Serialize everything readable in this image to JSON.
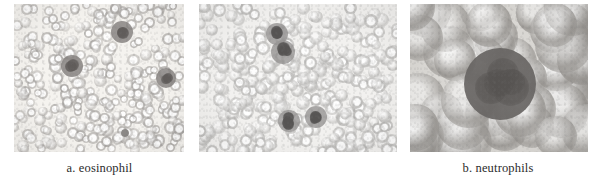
{
  "figure": {
    "background_color": "#ffffff",
    "panel_count": 3,
    "caption_color": "#2b2b2b",
    "panels": [
      {
        "id": "eosinophil",
        "caption": "a. eosinophil",
        "label_letter": "a.",
        "cell_type": "eosinophil",
        "description": "low-power blood smear field, numerous pale ring-shaped red blood cells with three darker stained eosinophils",
        "field_background": "#f5f3ef",
        "rbc_color": "#b9b6b2",
        "wbc_color": "#8a8786",
        "magnification": "low"
      },
      {
        "id": "neutrophils",
        "caption": "b. neutrophils",
        "label_letter": "b.",
        "cell_type": "neutrophils",
        "description": "low-power blood smear field, dense pale red blood cells with four neutrophils having dark lobed nuclei",
        "field_background": "#f2f1ef",
        "rbc_color": "#c4c3c1",
        "wbc_color": "#6f6d6c",
        "magnification": "low"
      },
      {
        "id": "basophil",
        "caption": "c. basophil",
        "label_letter": "c.",
        "cell_type": "basophil",
        "description": "high-power view, large grey red blood cells surrounding one dark granular basophil at centre",
        "field_background": "#d9d7d3",
        "rbc_color": "#a8a6a2",
        "wbc_color": "#6a6866",
        "magnification": "high"
      }
    ]
  }
}
